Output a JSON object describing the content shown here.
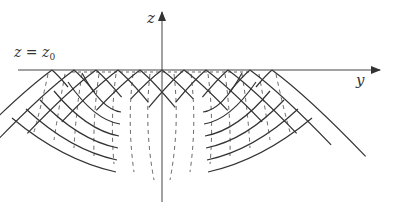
{
  "figure": {
    "type": "wavefront-diagram",
    "axes": {
      "vertical_label": "z",
      "horizontal_label": "y",
      "surface_label_lhs": "z",
      "surface_label_eq": "=",
      "surface_label_rhs": "z",
      "surface_label_sub": "0"
    },
    "geometry": {
      "origin_x": 162,
      "surface_y": 70,
      "surface_x_start": 18,
      "y_axis_end": 380,
      "z_axis_top": 12,
      "z_axis_bottom": 202,
      "peak_spacing": 22,
      "peaks_per_side": 6
    },
    "colors": {
      "solid_line": "#333333",
      "dashed_line": "#555555",
      "axis": "#444444"
    },
    "legend": {
      "solid": "wavefronts",
      "dashed": "rays"
    }
  }
}
